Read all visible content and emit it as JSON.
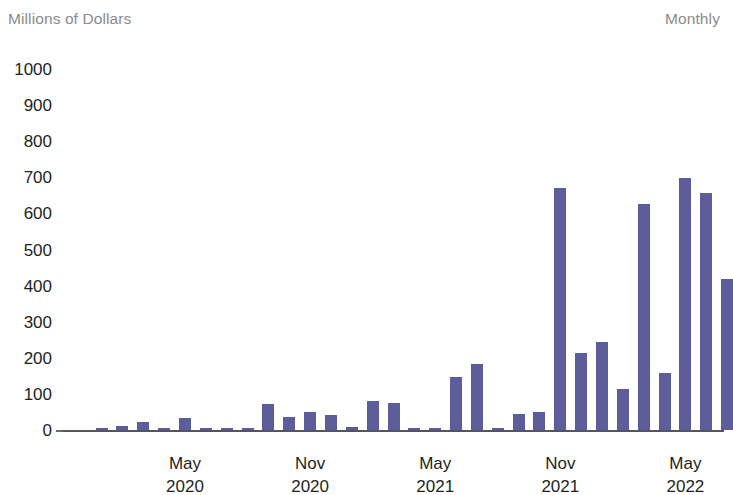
{
  "header": {
    "y_axis_units": "Millions of Dollars",
    "frequency": "Monthly"
  },
  "axis": {
    "y_ticks": [
      "1000",
      "900",
      "800",
      "700",
      "600",
      "500",
      "400",
      "300",
      "200",
      "100",
      "0"
    ],
    "x_ticks": [
      {
        "month": "May",
        "year": "2020"
      },
      {
        "month": "Nov",
        "year": "2020"
      },
      {
        "month": "May",
        "year": "2021"
      },
      {
        "month": "Nov",
        "year": "2021"
      },
      {
        "month": "May",
        "year": "2022"
      }
    ]
  },
  "style": {
    "bar_color": "#5d5d9c",
    "axis_color": "#555560",
    "label_color": "#231f20",
    "muted_color": "#8a8a8d"
  },
  "chart_data": {
    "type": "bar",
    "title": "",
    "subtitle": "",
    "xlabel": "",
    "ylabel": "Millions of Dollars",
    "annotations": [
      "Monthly"
    ],
    "ylim": [
      0,
      1000
    ],
    "ytick_step": 100,
    "grid": false,
    "legend": null,
    "x_tick_labels": [
      "May 2020",
      "Nov 2020",
      "May 2021",
      "Nov 2021",
      "May 2022"
    ],
    "categories": [
      "Jan 2020",
      "Feb 2020",
      "Mar 2020",
      "Apr 2020",
      "May 2020",
      "Jun 2020",
      "Jul 2020",
      "Aug 2020",
      "Sep 2020",
      "Oct 2020",
      "Nov 2020",
      "Dec 2020",
      "Jan 2021",
      "Feb 2021",
      "Mar 2021",
      "Apr 2021",
      "May 2021",
      "Jun 2021",
      "Jul 2021",
      "Aug 2021",
      "Sep 2021",
      "Oct 2021",
      "Nov 2021",
      "Dec 2021",
      "Jan 2022",
      "Feb 2022",
      "Mar 2022",
      "Apr 2022",
      "May 2022",
      "Jun 2022"
    ],
    "values": [
      2,
      10,
      22,
      4,
      33,
      3,
      3,
      3,
      73,
      37,
      50,
      41,
      8,
      81,
      76,
      4,
      3,
      147,
      182,
      3,
      45,
      50,
      671,
      214,
      245,
      113,
      625,
      159,
      697,
      657
    ],
    "trailing_values": [
      417,
      112
    ]
  },
  "bars": [
    {
      "label": "Jan 2020",
      "value": 2
    },
    {
      "label": "Feb 2020",
      "value": 10
    },
    {
      "label": "Mar 2020",
      "value": 22
    },
    {
      "label": "Apr 2020",
      "value": 4
    },
    {
      "label": "May 2020",
      "value": 33
    },
    {
      "label": "Jun 2020",
      "value": 3
    },
    {
      "label": "Jul 2020",
      "value": 3
    },
    {
      "label": "Aug 2020",
      "value": 3
    },
    {
      "label": "Sep 2020",
      "value": 73
    },
    {
      "label": "Oct 2020",
      "value": 37
    },
    {
      "label": "Nov 2020",
      "value": 50
    },
    {
      "label": "Dec 2020",
      "value": 41
    },
    {
      "label": "Jan 2021",
      "value": 8
    },
    {
      "label": "Feb 2021",
      "value": 81
    },
    {
      "label": "Mar 2021",
      "value": 76
    },
    {
      "label": "Apr 2021",
      "value": 4
    },
    {
      "label": "May 2021",
      "value": 3
    },
    {
      "label": "Jun 2021",
      "value": 147
    },
    {
      "label": "Jul 2021",
      "value": 182
    },
    {
      "label": "Aug 2021",
      "value": 3
    },
    {
      "label": "Sep 2021",
      "value": 45
    },
    {
      "label": "Oct 2021",
      "value": 50
    },
    {
      "label": "Nov 2021",
      "value": 671
    },
    {
      "label": "Dec 2021",
      "value": 214
    },
    {
      "label": "Jan 2022",
      "value": 245
    },
    {
      "label": "Feb 2022",
      "value": 113
    },
    {
      "label": "Mar 2022",
      "value": 625
    },
    {
      "label": "Apr 2022",
      "value": 159
    },
    {
      "label": "May 2022",
      "value": 697
    },
    {
      "label": "Jun 2022",
      "value": 657
    },
    {
      "label": "Jul 2022",
      "value": 417
    },
    {
      "label": "Aug 2022",
      "value": 112
    }
  ]
}
